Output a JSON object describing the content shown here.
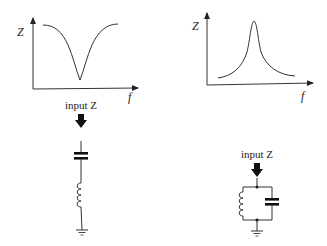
{
  "left_panel": {
    "graph": {
      "y_label": "Z",
      "x_label": "f",
      "curve_shape": "notch (series resonance, impedance minimum)"
    },
    "caption": "input Z",
    "circuit": {
      "type": "series LC",
      "components": [
        "capacitor",
        "inductor",
        "ground"
      ]
    }
  },
  "right_panel": {
    "graph": {
      "y_label": "Z",
      "x_label": "f",
      "curve_shape": "peak (parallel resonance, impedance maximum)"
    },
    "caption": "input Z",
    "circuit": {
      "type": "parallel LC",
      "components": [
        "inductor",
        "capacitor",
        "ground"
      ]
    }
  },
  "colors": {
    "line": "#333333",
    "arrow": "#111111",
    "background": "#ffffff"
  }
}
